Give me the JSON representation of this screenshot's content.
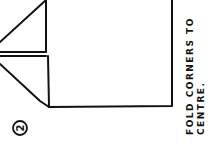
{
  "step": {
    "number": "2"
  },
  "instruction": {
    "line1": "FOLD CORNERS TO",
    "line2": "CENTRE."
  },
  "colors": {
    "ink": "#111111",
    "paper": "#ffffff"
  }
}
